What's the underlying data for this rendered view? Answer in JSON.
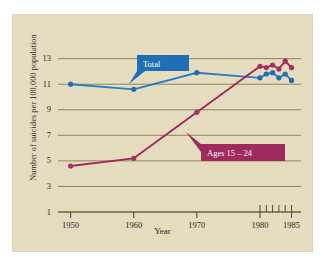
{
  "figure": {
    "background_color": "#e6dcc0",
    "page_background": "#ffffff"
  },
  "axes": {
    "y_title": "Number of suicides per 100,000 population",
    "x_title": "Year",
    "y_ticks": [
      "13",
      "11",
      "9",
      "7",
      "5",
      "3",
      "1"
    ],
    "x_ticks": [
      "1950",
      "1960",
      "1970",
      "1980",
      "1985"
    ]
  },
  "annotations": {
    "total": {
      "label": "Total",
      "color": "#1f6fb5"
    },
    "ages": {
      "label": "Ages 15 – 24",
      "color": "#9e2a5e"
    }
  },
  "chart_data": {
    "type": "line",
    "title": "",
    "xlabel": "Year",
    "ylabel": "Number of suicides per 100,000 population",
    "xlim": [
      1948,
      1986.5
    ],
    "ylim": [
      1,
      13.6
    ],
    "grid": true,
    "gridlines_y": [
      1,
      3,
      5,
      7,
      9,
      11,
      13
    ],
    "legend": "inline-callouts",
    "x_major_ticks": [
      1950,
      1960,
      1970,
      1980,
      1985
    ],
    "x_minor_ticks": [
      1980,
      1981,
      1982,
      1983,
      1984,
      1985
    ],
    "series": [
      {
        "name": "Total",
        "color": "#2a7fc1",
        "marker_color": "#1f6fb5",
        "x": [
          1950,
          1960,
          1970,
          1980,
          1981,
          1982,
          1983,
          1984,
          1985
        ],
        "values": [
          11.0,
          10.6,
          11.9,
          11.5,
          11.8,
          11.9,
          11.5,
          11.8,
          11.3
        ]
      },
      {
        "name": "Ages 15 – 24",
        "color": "#9e2a5e",
        "marker_color": "#a8305f",
        "x": [
          1950,
          1960,
          1970,
          1980,
          1981,
          1982,
          1983,
          1984,
          1985
        ],
        "values": [
          4.6,
          5.2,
          8.8,
          12.4,
          12.3,
          12.5,
          12.2,
          12.8,
          12.3
        ]
      }
    ]
  }
}
